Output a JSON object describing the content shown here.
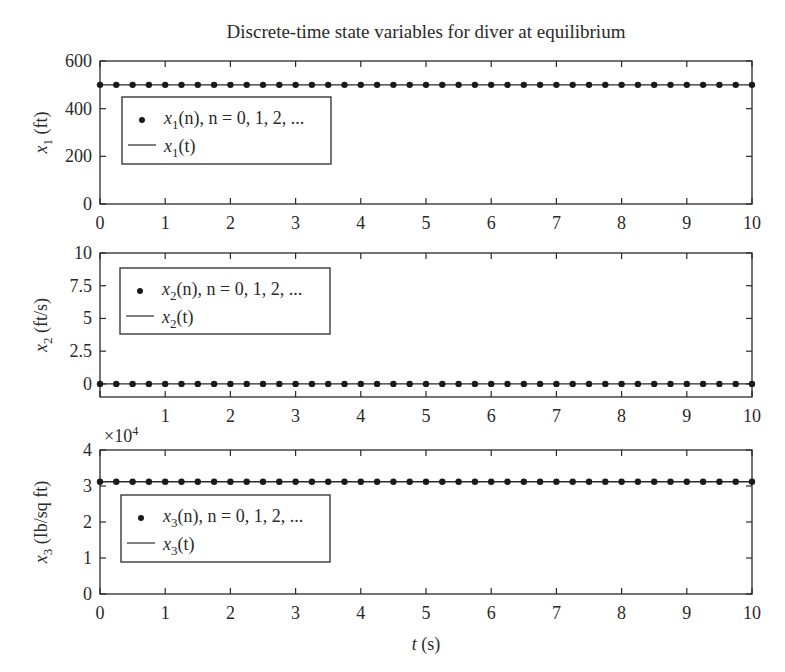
{
  "figure": {
    "title": "Discrete-time state variables for diver at equilibrium",
    "xlabel_var": "t",
    "xlabel_unit": " (s)",
    "line_color": "#2a2a2a",
    "marker_color": "#1a1a1a"
  },
  "chart_data": [
    {
      "type": "line",
      "title": "Discrete-time state variables for diver at equilibrium",
      "xlabel": "",
      "ylabel": "x1 (ft)",
      "ylabel_var": "x",
      "ylabel_sub": "1",
      "ylabel_unit": " (ft)",
      "xlim": [
        0,
        10
      ],
      "ylim": [
        0,
        600
      ],
      "xticks": [
        "0",
        "1",
        "2",
        "3",
        "4",
        "5",
        "6",
        "7",
        "8",
        "9",
        "10"
      ],
      "yticks": [
        0,
        200,
        400,
        600
      ],
      "ytick_labels": [
        "0",
        "200",
        "400",
        "600"
      ],
      "exponent_label": "",
      "grid": false,
      "legend_position": "upper left (inside)",
      "legend": [
        {
          "marker": "dot",
          "var": "x",
          "sub": "1",
          "text": "(n), n = 0, 1, 2, ..."
        },
        {
          "marker": "line",
          "var": "x",
          "sub": "1",
          "text": "(t)"
        }
      ],
      "series": [
        {
          "name": "x1(n), n = 0, 1, 2, ...",
          "style": "markers",
          "x_start": 0,
          "x_step": 0.25,
          "x_end": 10,
          "value": 500
        },
        {
          "name": "x1(t)",
          "style": "line",
          "x": [
            0,
            10
          ],
          "values": [
            500,
            500
          ]
        }
      ]
    },
    {
      "type": "line",
      "title": "",
      "xlabel": "",
      "ylabel": "x2 (ft/s)",
      "ylabel_var": "x",
      "ylabel_sub": "2",
      "ylabel_unit": " (ft/s)",
      "xlim": [
        0,
        10
      ],
      "ylim": [
        -1,
        10
      ],
      "xticks": [
        "",
        "1",
        "2",
        "3",
        "4",
        "5",
        "6",
        "7",
        "8",
        "9",
        "10"
      ],
      "yticks": [
        0,
        2.5,
        5,
        7.5,
        10
      ],
      "ytick_labels": [
        "0",
        "2.5",
        "5",
        "7.5",
        "10"
      ],
      "exponent_label": "",
      "grid": false,
      "legend_position": "upper left (inside)",
      "legend": [
        {
          "marker": "dot",
          "var": "x",
          "sub": "2",
          "text": "(n), n = 0, 1, 2, ..."
        },
        {
          "marker": "line",
          "var": "x",
          "sub": "2",
          "text": "(t)"
        }
      ],
      "series": [
        {
          "name": "x2(n), n = 0, 1, 2, ...",
          "style": "markers",
          "x_start": 0,
          "x_step": 0.25,
          "x_end": 10,
          "value": 0
        },
        {
          "name": "x2(t)",
          "style": "line",
          "x": [
            0,
            10
          ],
          "values": [
            0,
            0
          ]
        }
      ]
    },
    {
      "type": "line",
      "title": "",
      "xlabel": "t (s)",
      "ylabel": "x3 (lb/sq ft)",
      "ylabel_var": "x",
      "ylabel_sub": "3",
      "ylabel_unit": " (Ib/sq ft)",
      "xlim": [
        0,
        10
      ],
      "ylim": [
        0,
        4
      ],
      "xticks": [
        "0",
        "1",
        "2",
        "3",
        "4",
        "5",
        "6",
        "7",
        "8",
        "9",
        "10"
      ],
      "yticks": [
        0,
        1,
        2,
        3,
        4
      ],
      "ytick_labels": [
        "0",
        "1",
        "2",
        "3",
        "4"
      ],
      "exponent_label": "×10",
      "exponent_power": "4",
      "grid": false,
      "legend_position": "upper left (inside)",
      "legend": [
        {
          "marker": "dot",
          "var": "x",
          "sub": "3",
          "text": "(n), n = 0, 1, 2, ..."
        },
        {
          "marker": "line",
          "var": "x",
          "sub": "3",
          "text": "(t)"
        }
      ],
      "series": [
        {
          "name": "x3(n), n = 0, 1, 2, ...",
          "style": "markers",
          "x_start": 0,
          "x_step": 0.25,
          "x_end": 10,
          "value": 3.12
        },
        {
          "name": "x3(t)",
          "style": "line",
          "x": [
            0,
            10
          ],
          "values": [
            3.12,
            3.12
          ]
        }
      ]
    }
  ],
  "layout": {
    "axes": [
      {
        "left": 100,
        "right": 752,
        "top": 61,
        "bottom": 204,
        "legend": {
          "x": 122,
          "y": 97,
          "w": 209,
          "h": 67
        }
      },
      {
        "left": 100,
        "right": 752,
        "top": 253,
        "bottom": 397,
        "legend": {
          "x": 120,
          "y": 268,
          "w": 210,
          "h": 66
        }
      },
      {
        "left": 100,
        "right": 752,
        "top": 450,
        "bottom": 594,
        "legend": {
          "x": 121,
          "y": 495,
          "w": 209,
          "h": 67
        }
      }
    ]
  }
}
